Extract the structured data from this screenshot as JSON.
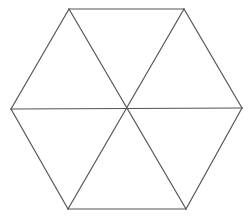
{
  "diagram": {
    "type": "geometric-figure",
    "shape": "regular hexagon divided into six equilateral triangles",
    "stroke_color": "#555555",
    "background_color": "#ffffff",
    "vertices": {
      "top_left": [
        69,
        9
      ],
      "top_right": [
        184,
        9
      ],
      "right": [
        242,
        108
      ],
      "bottom_right": [
        186,
        209
      ],
      "bottom_left": [
        68,
        209
      ],
      "left": [
        11,
        109
      ],
      "center": [
        126,
        109
      ]
    },
    "outer_edges": [
      [
        "top_left",
        "top_right"
      ],
      [
        "top_right",
        "right"
      ],
      [
        "right",
        "bottom_right"
      ],
      [
        "bottom_right",
        "bottom_left"
      ],
      [
        "bottom_left",
        "left"
      ],
      [
        "left",
        "top_left"
      ]
    ],
    "inner_edges": [
      [
        "top_left",
        "bottom_right"
      ],
      [
        "top_right",
        "bottom_left"
      ],
      [
        "left",
        "right"
      ]
    ],
    "triangle_count": 6
  }
}
